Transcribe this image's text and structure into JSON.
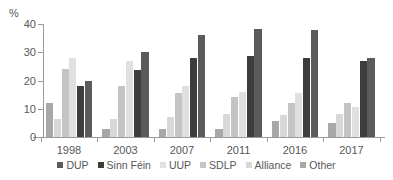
{
  "axis": {
    "ylabel": "%",
    "yticks": [
      "0",
      "10",
      "20",
      "30",
      "40"
    ],
    "xlabels": [
      "1998",
      "2003",
      "2007",
      "2011",
      "2016",
      "2017"
    ]
  },
  "legend": {
    "items": [
      {
        "label": "DUP",
        "color": "#5b5b5b"
      },
      {
        "label": "Sinn Féin",
        "color": "#3d3d3d"
      },
      {
        "label": "UUP",
        "color": "#e0e0e0"
      },
      {
        "label": "SDLP",
        "color": "#c4c4c4"
      },
      {
        "label": "Alliance",
        "color": "#d8d8d8"
      },
      {
        "label": "Other",
        "color": "#a8a8a8"
      }
    ]
  },
  "chart_data": {
    "type": "bar",
    "title": "",
    "xlabel": "",
    "ylabel": "%",
    "ylim": [
      0,
      40
    ],
    "grid": false,
    "legend_position": "bottom",
    "categories": [
      "1998",
      "2003",
      "2007",
      "2011",
      "2016",
      "2017"
    ],
    "series": [
      {
        "name": "Other",
        "color": "#a8a8a8",
        "values": [
          12.0,
          2.8,
          2.8,
          2.9,
          5.7,
          4.8
        ]
      },
      {
        "name": "Alliance",
        "color": "#d8d8d8",
        "values": [
          6.4,
          6.3,
          7.2,
          8.1,
          7.8,
          8.3
        ]
      },
      {
        "name": "SDLP",
        "color": "#c4c4c4",
        "values": [
          24.0,
          18.0,
          15.6,
          14.0,
          12.2,
          12.0
        ]
      },
      {
        "name": "UUP",
        "color": "#e0e0e0",
        "values": [
          27.8,
          26.9,
          17.9,
          16.0,
          15.6,
          10.6
        ]
      },
      {
        "name": "Sinn Féin",
        "color": "#3d3d3d",
        "values": [
          18.0,
          23.8,
          27.8,
          28.8,
          27.8,
          26.8
        ]
      },
      {
        "name": "DUP",
        "color": "#5b5b5b",
        "values": [
          20.0,
          30.0,
          36.0,
          38.2,
          38.0,
          28.0
        ]
      }
    ]
  }
}
